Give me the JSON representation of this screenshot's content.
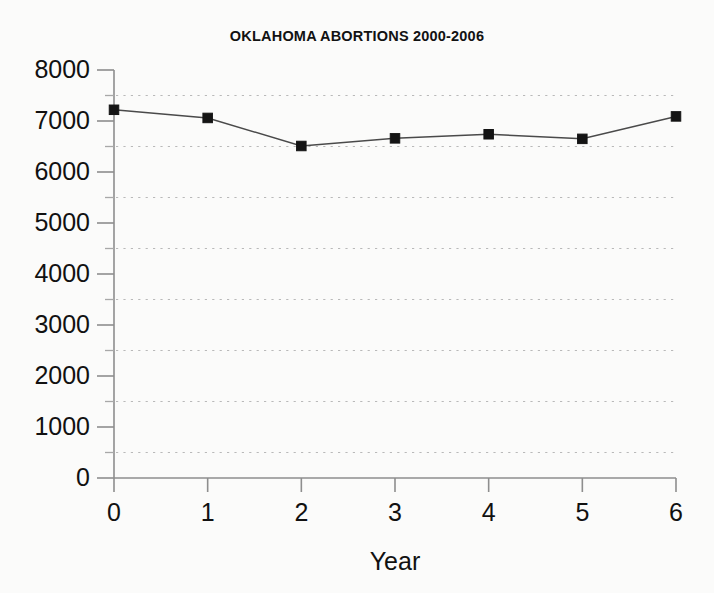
{
  "chart_data": {
    "type": "line",
    "title": "OKLAHOMA ABORTIONS 2000-2006",
    "xlabel": "Year",
    "ylabel": "",
    "x": [
      0,
      1,
      2,
      3,
      4,
      5,
      6
    ],
    "values": [
      7220,
      7060,
      6510,
      6660,
      6740,
      6650,
      7090
    ],
    "series": [
      {
        "name": "Abortions",
        "values": [
          7220,
          7060,
          6510,
          6660,
          6740,
          6650,
          7090
        ]
      }
    ],
    "xlim": [
      0,
      6
    ],
    "ylim": [
      0,
      8000
    ],
    "x_ticks": [
      0,
      1,
      2,
      3,
      4,
      5,
      6
    ],
    "x_tick_labels": [
      "0",
      "1",
      "2",
      "3",
      "4",
      "5",
      "6"
    ],
    "y_ticks": [
      0,
      1000,
      2000,
      3000,
      4000,
      5000,
      6000,
      7000,
      8000
    ],
    "y_tick_labels": [
      "0",
      "1000",
      "2000",
      "3000",
      "4000",
      "5000",
      "6000",
      "7000",
      "8000"
    ],
    "y_minor_ticks": [
      500,
      1500,
      2500,
      3500,
      4500,
      5500,
      6500,
      7500
    ],
    "gridlines": {
      "horizontal": [
        500,
        1500,
        2500,
        3500,
        4500,
        5500,
        6500,
        7500
      ],
      "vertical": [],
      "style": "dotted",
      "color": "#b9b9b9"
    },
    "legend": null,
    "legend_position": "none",
    "marker_style": "square",
    "colors": {
      "line": "#4a4a4a",
      "marker": "#141414",
      "axis": "#8e8e8e",
      "text": "#111111",
      "background": "#fbfbfa"
    }
  }
}
